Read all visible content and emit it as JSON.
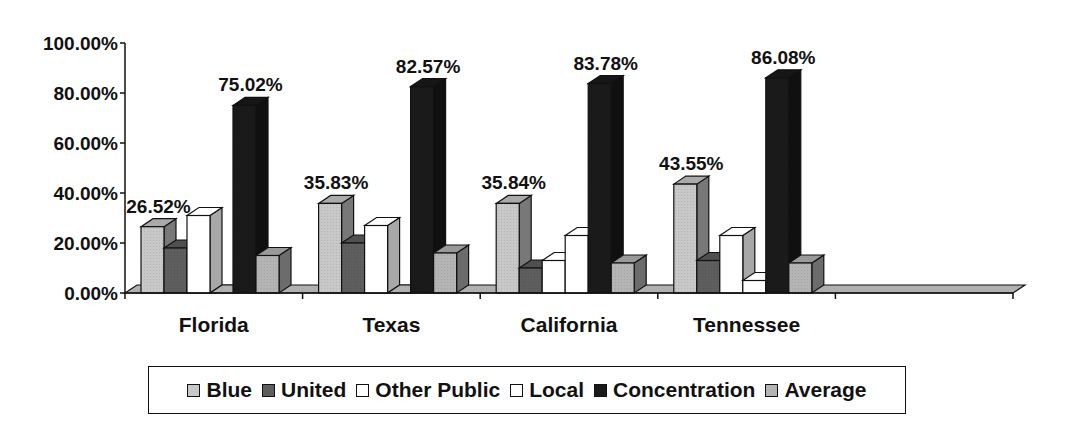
{
  "chart_data": {
    "type": "bar",
    "style": "3d-clustered-column",
    "title": "",
    "xlabel": "",
    "ylabel": "",
    "categories": [
      "Florida",
      "Texas",
      "California",
      "Tennessee",
      ""
    ],
    "ylim": [
      0,
      100
    ],
    "y_ticks": [
      "0.00%",
      "20.00%",
      "40.00%",
      "60.00%",
      "80.00%",
      "100.00%"
    ],
    "grid": false,
    "legend_position": "bottom",
    "series": [
      {
        "name": "Blue",
        "color": "#c8c8c8",
        "values": [
          26.52,
          35.83,
          35.84,
          43.55,
          null
        ]
      },
      {
        "name": "United",
        "color": "#5e5e5e",
        "values": [
          18,
          20,
          10,
          13,
          null
        ]
      },
      {
        "name": "Other Public",
        "color": "#ffffff",
        "values": [
          31,
          27,
          13,
          23,
          null
        ]
      },
      {
        "name": "Local",
        "color": "#ffffff",
        "values": [
          0,
          0,
          23,
          5,
          null
        ]
      },
      {
        "name": "Concentration",
        "color": "#1a1a1a",
        "values": [
          75.02,
          82.57,
          83.78,
          86.08,
          null
        ]
      },
      {
        "name": "Average",
        "color": "#b4b4b4",
        "values": [
          15,
          16,
          12,
          12,
          null
        ]
      }
    ],
    "data_labels": [
      {
        "category": "Florida",
        "series": "Blue",
        "text": "26.52%"
      },
      {
        "category": "Florida",
        "series": "Concentration",
        "text": "75.02%"
      },
      {
        "category": "Texas",
        "series": "Blue",
        "text": "35.83%"
      },
      {
        "category": "Texas",
        "series": "Concentration",
        "text": "82.57%"
      },
      {
        "category": "California",
        "series": "Blue",
        "text": "35.84%"
      },
      {
        "category": "California",
        "series": "Concentration",
        "text": "83.78%"
      },
      {
        "category": "Tennessee",
        "series": "Blue",
        "text": "43.55%"
      },
      {
        "category": "Tennessee",
        "series": "Concentration",
        "text": "86.08%"
      }
    ]
  },
  "legend": {
    "items": [
      {
        "label": "Blue",
        "color": "#c8c8c8"
      },
      {
        "label": "United",
        "color": "#5e5e5e"
      },
      {
        "label": "Other Public",
        "color": "#ffffff"
      },
      {
        "label": "Local",
        "color": "#ffffff"
      },
      {
        "label": "Concentration",
        "color": "#1a1a1a"
      },
      {
        "label": "Average",
        "color": "#b4b4b4"
      }
    ]
  }
}
